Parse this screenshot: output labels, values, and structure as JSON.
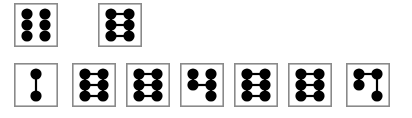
{
  "figure": {
    "title": "",
    "background_color": "#ffffff",
    "frame_color": "#8a8a8a",
    "node_color": "#000000",
    "edge_color": "#000000",
    "canvas": {
      "width": 412,
      "height": 118
    },
    "grid": {
      "columns": 2,
      "rows": 3,
      "node_radius": 5.6,
      "col_offsets": [
        13,
        31
      ],
      "row_offsets": [
        11,
        22,
        33
      ]
    },
    "rows": [
      {
        "name": "top-row",
        "y": 3,
        "cell_size": {
          "width": 44,
          "height": 44
        },
        "cells": [
          {
            "id": "cell-t1",
            "label": "six-nodes-no-edges",
            "x": 14,
            "nodes": [
              {
                "col": 0,
                "row": 0
              },
              {
                "col": 1,
                "row": 0
              },
              {
                "col": 0,
                "row": 1
              },
              {
                "col": 1,
                "row": 1
              },
              {
                "col": 0,
                "row": 2
              },
              {
                "col": 1,
                "row": 2
              }
            ],
            "edges": []
          },
          {
            "id": "cell-t2",
            "label": "ladder-three-rungs",
            "x": 98,
            "nodes": [
              {
                "col": 0,
                "row": 0
              },
              {
                "col": 1,
                "row": 0
              },
              {
                "col": 0,
                "row": 1
              },
              {
                "col": 1,
                "row": 1
              },
              {
                "col": 0,
                "row": 2
              },
              {
                "col": 1,
                "row": 2
              }
            ],
            "edges": [
              {
                "from": [
                  0,
                  0
                ],
                "to": [
                  1,
                  0
                ]
              },
              {
                "from": [
                  0,
                  1
                ],
                "to": [
                  1,
                  1
                ]
              },
              {
                "from": [
                  0,
                  2
                ],
                "to": [
                  1,
                  2
                ]
              },
              {
                "from": [
                  0,
                  0
                ],
                "to": [
                  0,
                  1
                ]
              },
              {
                "from": [
                  0,
                  1
                ],
                "to": [
                  0,
                  2
                ]
              },
              {
                "from": [
                  1,
                  0
                ],
                "to": [
                  1,
                  1
                ]
              },
              {
                "from": [
                  1,
                  1
                ],
                "to": [
                  1,
                  2
                ]
              }
            ]
          }
        ]
      },
      {
        "name": "bottom-row",
        "y": 63,
        "cell_size": {
          "width": 44,
          "height": 44
        },
        "cells": [
          {
            "id": "cell-b1",
            "label": "two-nodes-vertical-edge",
            "x": 14,
            "nodes": [
              {
                "col": 0,
                "row": 0
              },
              {
                "col": 0,
                "row": 2
              }
            ],
            "edges": [
              {
                "from": [
                  0,
                  0
                ],
                "to": [
                  0,
                  2
                ]
              }
            ],
            "col_override": [
              22,
              22
            ]
          },
          {
            "id": "cell-b2",
            "label": "ladder-three-rungs",
            "x": 72,
            "nodes": [
              {
                "col": 0,
                "row": 0
              },
              {
                "col": 1,
                "row": 0
              },
              {
                "col": 0,
                "row": 1
              },
              {
                "col": 1,
                "row": 1
              },
              {
                "col": 0,
                "row": 2
              },
              {
                "col": 1,
                "row": 2
              }
            ],
            "edges": [
              {
                "from": [
                  0,
                  0
                ],
                "to": [
                  1,
                  0
                ]
              },
              {
                "from": [
                  0,
                  1
                ],
                "to": [
                  1,
                  1
                ]
              },
              {
                "from": [
                  0,
                  2
                ],
                "to": [
                  1,
                  2
                ]
              },
              {
                "from": [
                  0,
                  0
                ],
                "to": [
                  0,
                  1
                ]
              },
              {
                "from": [
                  0,
                  1
                ],
                "to": [
                  0,
                  2
                ]
              },
              {
                "from": [
                  1,
                  0
                ],
                "to": [
                  1,
                  1
                ]
              },
              {
                "from": [
                  1,
                  1
                ],
                "to": [
                  1,
                  2
                ]
              }
            ]
          },
          {
            "id": "cell-b3",
            "label": "ladder-three-rungs",
            "x": 126,
            "nodes": [
              {
                "col": 0,
                "row": 0
              },
              {
                "col": 1,
                "row": 0
              },
              {
                "col": 0,
                "row": 1
              },
              {
                "col": 1,
                "row": 1
              },
              {
                "col": 0,
                "row": 2
              },
              {
                "col": 1,
                "row": 2
              }
            ],
            "edges": [
              {
                "from": [
                  0,
                  0
                ],
                "to": [
                  1,
                  0
                ]
              },
              {
                "from": [
                  0,
                  1
                ],
                "to": [
                  1,
                  1
                ]
              },
              {
                "from": [
                  0,
                  2
                ],
                "to": [
                  1,
                  2
                ]
              },
              {
                "from": [
                  0,
                  0
                ],
                "to": [
                  0,
                  1
                ]
              },
              {
                "from": [
                  0,
                  1
                ],
                "to": [
                  0,
                  2
                ]
              },
              {
                "from": [
                  1,
                  0
                ],
                "to": [
                  1,
                  1
                ]
              },
              {
                "from": [
                  1,
                  1
                ],
                "to": [
                  1,
                  2
                ]
              }
            ]
          },
          {
            "id": "cell-b4",
            "label": "five-nodes-middle-rung",
            "x": 180,
            "nodes": [
              {
                "col": 0,
                "row": 0
              },
              {
                "col": 1,
                "row": 0
              },
              {
                "col": 0,
                "row": 1
              },
              {
                "col": 1,
                "row": 1
              },
              {
                "col": 1,
                "row": 2
              }
            ],
            "edges": [
              {
                "from": [
                  0,
                  1
                ],
                "to": [
                  1,
                  1
                ]
              },
              {
                "from": [
                  0,
                  0
                ],
                "to": [
                  0,
                  1
                ]
              },
              {
                "from": [
                  1,
                  0
                ],
                "to": [
                  1,
                  1
                ]
              },
              {
                "from": [
                  1,
                  1
                ],
                "to": [
                  1,
                  2
                ]
              }
            ]
          },
          {
            "id": "cell-b5",
            "label": "ladder-three-rungs",
            "x": 234,
            "nodes": [
              {
                "col": 0,
                "row": 0
              },
              {
                "col": 1,
                "row": 0
              },
              {
                "col": 0,
                "row": 1
              },
              {
                "col": 1,
                "row": 1
              },
              {
                "col": 0,
                "row": 2
              },
              {
                "col": 1,
                "row": 2
              }
            ],
            "edges": [
              {
                "from": [
                  0,
                  0
                ],
                "to": [
                  1,
                  0
                ]
              },
              {
                "from": [
                  0,
                  1
                ],
                "to": [
                  1,
                  1
                ]
              },
              {
                "from": [
                  0,
                  2
                ],
                "to": [
                  1,
                  2
                ]
              },
              {
                "from": [
                  0,
                  0
                ],
                "to": [
                  0,
                  1
                ]
              },
              {
                "from": [
                  0,
                  1
                ],
                "to": [
                  0,
                  2
                ]
              },
              {
                "from": [
                  1,
                  0
                ],
                "to": [
                  1,
                  1
                ]
              },
              {
                "from": [
                  1,
                  1
                ],
                "to": [
                  1,
                  2
                ]
              }
            ]
          },
          {
            "id": "cell-b6",
            "label": "ladder-three-rungs",
            "x": 288,
            "nodes": [
              {
                "col": 0,
                "row": 0
              },
              {
                "col": 1,
                "row": 0
              },
              {
                "col": 0,
                "row": 1
              },
              {
                "col": 1,
                "row": 1
              },
              {
                "col": 0,
                "row": 2
              },
              {
                "col": 1,
                "row": 2
              }
            ],
            "edges": [
              {
                "from": [
                  0,
                  0
                ],
                "to": [
                  1,
                  0
                ]
              },
              {
                "from": [
                  0,
                  1
                ],
                "to": [
                  1,
                  1
                ]
              },
              {
                "from": [
                  0,
                  2
                ],
                "to": [
                  1,
                  2
                ]
              },
              {
                "from": [
                  0,
                  0
                ],
                "to": [
                  0,
                  1
                ]
              },
              {
                "from": [
                  0,
                  1
                ],
                "to": [
                  0,
                  2
                ]
              },
              {
                "from": [
                  1,
                  0
                ],
                "to": [
                  1,
                  1
                ]
              },
              {
                "from": [
                  1,
                  1
                ],
                "to": [
                  1,
                  2
                ]
              }
            ]
          },
          {
            "id": "cell-b7",
            "label": "four-nodes-top-rung",
            "x": 346,
            "nodes": [
              {
                "col": 0,
                "row": 0
              },
              {
                "col": 1,
                "row": 0
              },
              {
                "col": 0,
                "row": 1
              },
              {
                "col": 1,
                "row": 2
              }
            ],
            "edges": [
              {
                "from": [
                  0,
                  0
                ],
                "to": [
                  1,
                  0
                ]
              },
              {
                "from": [
                  0,
                  0
                ],
                "to": [
                  0,
                  1
                ]
              },
              {
                "from": [
                  1,
                  0
                ],
                "to": [
                  1,
                  2
                ]
              }
            ]
          }
        ]
      }
    ]
  }
}
